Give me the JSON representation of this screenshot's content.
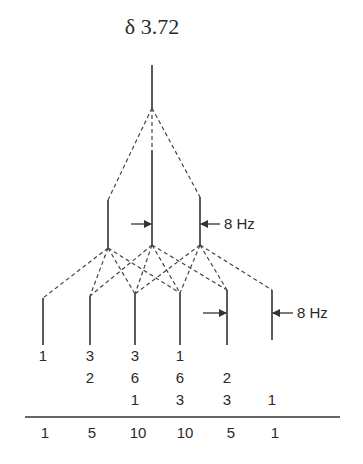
{
  "title": "δ 3.72",
  "coupling_labels": {
    "first_split": "8 Hz",
    "second_split": "8 Hz"
  },
  "tree": {
    "level_0": {
      "lines": 1,
      "x": [
        152
      ]
    },
    "level_1": {
      "lines": 3,
      "x": [
        108,
        152,
        200
      ],
      "pattern": "1:1:1 (triplet-like split, J = 8 Hz)"
    },
    "level_2": {
      "lines": 6,
      "x": [
        43,
        90,
        135,
        180,
        227,
        272
      ]
    }
  },
  "intensity_rows": [
    {
      "cells": [
        "1",
        "3",
        "3",
        "1",
        "",
        ""
      ]
    },
    {
      "cells": [
        "",
        "2",
        "6",
        "6",
        "2",
        ""
      ]
    },
    {
      "cells": [
        "",
        "",
        "1",
        "3",
        "3",
        "1"
      ]
    }
  ],
  "sum_row": {
    "cells": [
      "1",
      "5",
      "10",
      "10",
      "5",
      "1"
    ]
  },
  "colors": {
    "ink": "#333333",
    "background": "#ffffff"
  }
}
